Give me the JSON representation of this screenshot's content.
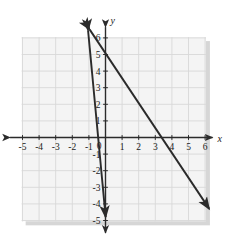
{
  "figure": {
    "type": "coordinate-plane",
    "axis_labels": {
      "x": "x",
      "y": "y"
    },
    "x_ticks": [
      "-5",
      "-4",
      "-3",
      "-2",
      "-1",
      "1",
      "2",
      "3",
      "4",
      "5",
      "6"
    ],
    "y_ticks": [
      "6",
      "5",
      "4",
      "3",
      "2",
      "1",
      "-1",
      "-2",
      "-3",
      "-4",
      "-5"
    ],
    "origin_label": "0",
    "x_range": [
      -5.6,
      6.3
    ],
    "y_range": [
      -5.1,
      6.6
    ],
    "grid": true,
    "colors": {
      "grid": "#d8d8d8",
      "panel": "#f2f2f2",
      "axis": "#2b2b2b",
      "line": "#2b2b2b",
      "shadow": "#b5b5b5"
    },
    "lines": [
      {
        "name": "steep-line",
        "slope": -10.6,
        "intercept": -4.6,
        "from": {
          "x": -1.05,
          "y": 6.45
        },
        "to": {
          "x": 0.01,
          "y": -4.8
        },
        "arrows": "both"
      },
      {
        "name": "shallow-line",
        "slope": -1.5,
        "intercept": 5.1,
        "from": {
          "x": -0.95,
          "y": 6.5
        },
        "to": {
          "x": 6.25,
          "y": -4.3
        },
        "arrows": "both"
      }
    ]
  }
}
